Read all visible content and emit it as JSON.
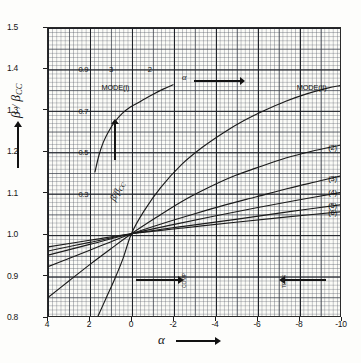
{
  "figure": {
    "y_axis_title": "β / β",
    "y_axis_title_sub": "CC",
    "x_axis_title": "α",
    "inner_axis_title": "β/β",
    "inner_axis_title_sub": "CC",
    "top_alpha_label": "α"
  },
  "axes": {
    "y_ticks": [
      "1.5",
      "1.4",
      "1.3",
      "1.2",
      "1.1",
      "1.0",
      "0.9",
      "0.8"
    ],
    "y_tick_values": [
      1.5,
      1.4,
      1.3,
      1.2,
      1.1,
      1.0,
      0.9,
      0.8
    ],
    "x_ticks": [
      "4",
      "2",
      "0",
      "-2",
      "-4",
      "-6",
      "-8",
      "-10"
    ],
    "x_tick_values": [
      4,
      2,
      0,
      -2,
      -4,
      -6,
      -8,
      -10
    ],
    "xlim": [
      4,
      -10
    ],
    "ylim": [
      0.8,
      1.5
    ],
    "grid": "graph-paper, minor every 0.2 alpha / 0.005 ratio, major every 2 alpha / 0.1 ratio"
  },
  "inner_scale_labels": [
    {
      "text": "0.9",
      "alpha": 2.55,
      "ratio": 1.4005
    },
    {
      "text": "0.7",
      "alpha": 2.55,
      "ratio": 1.3005
    },
    {
      "text": "0.5",
      "alpha": 2.55,
      "ratio": 1.2005
    },
    {
      "text": "0.3",
      "alpha": 2.55,
      "ratio": 1.1005
    }
  ],
  "top_scale_labels": [
    {
      "text": "3",
      "alpha": 1.1,
      "ratio": 1.4005
    },
    {
      "text": "2",
      "alpha": -0.75,
      "ratio": 1.4005
    }
  ],
  "mode_labels": [
    {
      "text": "MODE(I)",
      "alpha": 1.45,
      "ratio": 1.357
    },
    {
      "text": "MODE(II)",
      "alpha": -7.85,
      "ratio": 1.357
    }
  ],
  "curve_labels": [
    {
      "text": "(2)",
      "alpha": -9.35,
      "ratio": 1.213
    },
    {
      "text": "(3)",
      "alpha": -9.35,
      "ratio": 1.138
    },
    {
      "text": "(4)",
      "alpha": -9.35,
      "ratio": 1.105
    },
    {
      "text": "(5)",
      "alpha": -9.35,
      "ratio": 1.073
    },
    {
      "text": "(6)",
      "alpha": -9.35,
      "ratio": 1.055
    }
  ],
  "annotations": [
    {
      "name": "compression-arrow-right",
      "text": "COMP",
      "alpha": -2.3,
      "ratio": 0.893,
      "direction": "right"
    },
    {
      "name": "tension-arrow-left",
      "text": "TENS",
      "alpha": -7.05,
      "ratio": 0.893,
      "direction": "left"
    }
  ],
  "chart_data": {
    "type": "line",
    "title": "",
    "xlabel": "α",
    "ylabel": "β / β_CC",
    "xlim": [
      4,
      -10
    ],
    "ylim": [
      0.8,
      1.5
    ],
    "grid": true,
    "legend": "inline curve labels at right edge",
    "series": [
      {
        "name": "MODE(I) upper branch",
        "label": "MODE(I)",
        "points": [
          [
            1.75,
            1.15
          ],
          [
            1.55,
            1.192
          ],
          [
            1.35,
            1.222
          ],
          [
            1.1,
            1.248
          ],
          [
            0.8,
            1.272
          ],
          [
            0.45,
            1.292
          ],
          [
            0.05,
            1.308
          ],
          [
            -0.45,
            1.322
          ],
          [
            -1.0,
            1.338
          ],
          [
            -1.55,
            1.352
          ],
          [
            -2.0,
            1.362
          ]
        ]
      },
      {
        "name": "MODE(II) primary",
        "label": "MODE(II)",
        "points": [
          [
            1.6,
            0.8
          ],
          [
            1.2,
            0.845
          ],
          [
            0.8,
            0.89
          ],
          [
            0.4,
            0.94
          ],
          [
            0.0,
            1.0
          ],
          [
            -0.6,
            1.055
          ],
          [
            -1.4,
            1.112
          ],
          [
            -2.4,
            1.168
          ],
          [
            -3.4,
            1.21
          ],
          [
            -4.4,
            1.245
          ],
          [
            -5.4,
            1.275
          ],
          [
            -6.4,
            1.3
          ],
          [
            -7.4,
            1.322
          ],
          [
            -8.4,
            1.34
          ],
          [
            -9.4,
            1.354
          ],
          [
            -10.0,
            1.36
          ]
        ]
      },
      {
        "name": "curve (2)",
        "label": "(2)",
        "points": [
          [
            4.0,
            0.845
          ],
          [
            3.0,
            0.885
          ],
          [
            2.0,
            0.925
          ],
          [
            1.0,
            0.963
          ],
          [
            0.0,
            1.0
          ],
          [
            -1.2,
            1.04
          ],
          [
            -2.4,
            1.078
          ],
          [
            -3.6,
            1.11
          ],
          [
            -4.8,
            1.138
          ],
          [
            -6.0,
            1.16
          ],
          [
            -7.4,
            1.184
          ],
          [
            -8.6,
            1.2
          ],
          [
            -10.0,
            1.215
          ]
        ]
      },
      {
        "name": "curve (3)",
        "label": "(3)",
        "points": [
          [
            4.0,
            0.92
          ],
          [
            3.0,
            0.94
          ],
          [
            2.0,
            0.96
          ],
          [
            1.0,
            0.98
          ],
          [
            0.0,
            1.0
          ],
          [
            -1.5,
            1.025
          ],
          [
            -3.0,
            1.048
          ],
          [
            -4.5,
            1.07
          ],
          [
            -6.0,
            1.09
          ],
          [
            -7.5,
            1.11
          ],
          [
            -9.0,
            1.128
          ],
          [
            -10.0,
            1.14
          ]
        ]
      },
      {
        "name": "curve (4)",
        "label": "(4)",
        "points": [
          [
            4.0,
            0.948
          ],
          [
            2.0,
            0.974
          ],
          [
            0.0,
            1.0
          ],
          [
            -2.0,
            1.022
          ],
          [
            -4.0,
            1.043
          ],
          [
            -6.0,
            1.063
          ],
          [
            -8.0,
            1.082
          ],
          [
            -10.0,
            1.1
          ]
        ]
      },
      {
        "name": "curve (5)",
        "label": "(5)",
        "points": [
          [
            4.0,
            0.958
          ],
          [
            2.0,
            0.979
          ],
          [
            0.0,
            1.0
          ],
          [
            -2.5,
            1.018
          ],
          [
            -5.0,
            1.035
          ],
          [
            -7.5,
            1.053
          ],
          [
            -10.0,
            1.07
          ]
        ]
      },
      {
        "name": "curve (6)",
        "label": "(6)",
        "points": [
          [
            4.0,
            0.968
          ],
          [
            2.0,
            0.984
          ],
          [
            0.0,
            1.0
          ],
          [
            -2.5,
            1.014
          ],
          [
            -5.0,
            1.028
          ],
          [
            -7.5,
            1.041
          ],
          [
            -10.0,
            1.053
          ]
        ]
      }
    ]
  }
}
